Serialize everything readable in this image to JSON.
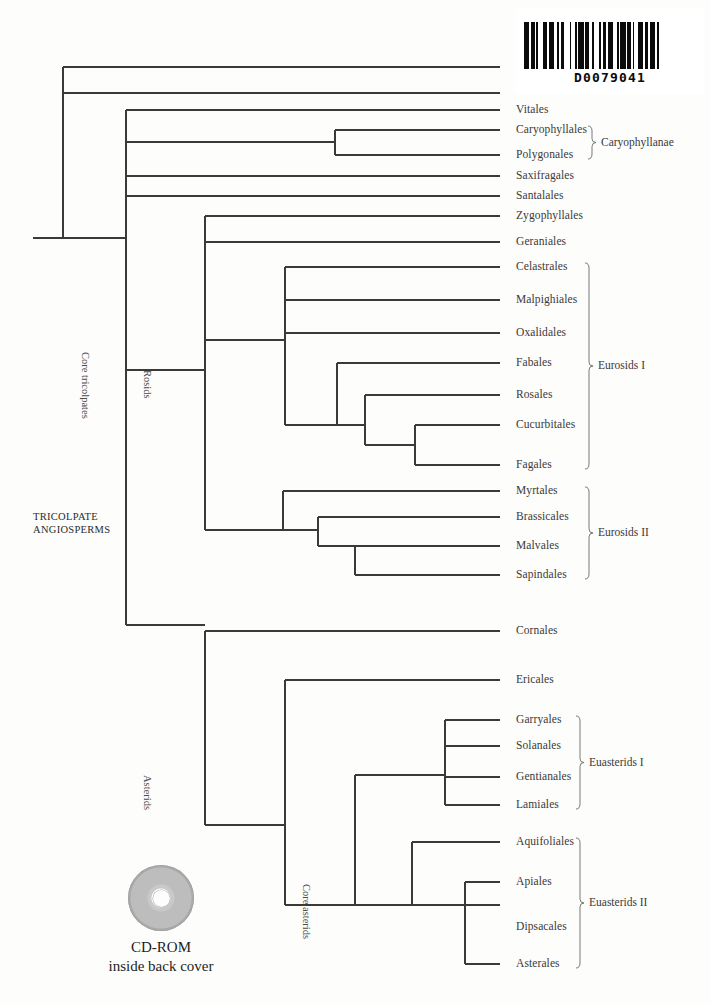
{
  "page": {
    "background_color": "#fdfdfc",
    "line_color": "#3a3a38"
  },
  "barcode": {
    "name": "barcode",
    "code_text": "D0079041",
    "bar_pattern": "3,1,2,1,1,3,2,1,3,2,1,1,2,3,1,2,1,1,3,1,2,2,1,3,1,1,2,1,3,2,1,1,3,1,2,1,1,2,3,1,2,1,3,1,1,2"
  },
  "root": {
    "label_line1": "TRICOLPATE",
    "label_line2": "ANGIOSPERMS"
  },
  "cdrom": {
    "line1": "CD-ROM",
    "line2": "inside back cover",
    "icon": "cd-disc-icon"
  },
  "chart_data": {
    "type": "tree",
    "orientation": "horizontal-rectangular",
    "tips": [
      {
        "name": "Vitales",
        "x": 500,
        "y": 110
      },
      {
        "name": "Caryophyllales",
        "x": 500,
        "y": 130
      },
      {
        "name": "Polygonales",
        "x": 500,
        "y": 155
      },
      {
        "name": "Saxifragales",
        "x": 500,
        "y": 176
      },
      {
        "name": "Santalales",
        "x": 500,
        "y": 196
      },
      {
        "name": "Zygophyllales",
        "x": 500,
        "y": 216
      },
      {
        "name": "Geraniales",
        "x": 500,
        "y": 242
      },
      {
        "name": "Celastrales",
        "x": 500,
        "y": 267
      },
      {
        "name": "Malpighiales",
        "x": 500,
        "y": 300
      },
      {
        "name": "Oxalidales",
        "x": 500,
        "y": 333
      },
      {
        "name": "Fabales",
        "x": 500,
        "y": 363
      },
      {
        "name": "Rosales",
        "x": 500,
        "y": 395
      },
      {
        "name": "Cucurbitales",
        "x": 500,
        "y": 425
      },
      {
        "name": "Fagales",
        "x": 500,
        "y": 465
      },
      {
        "name": "Myrtales",
        "x": 500,
        "y": 491
      },
      {
        "name": "Brassicales",
        "x": 500,
        "y": 517
      },
      {
        "name": "Malvales",
        "x": 500,
        "y": 546
      },
      {
        "name": "Sapindales",
        "x": 500,
        "y": 575
      },
      {
        "name": "Cornales",
        "x": 500,
        "y": 631
      },
      {
        "name": "Ericales",
        "x": 500,
        "y": 680
      },
      {
        "name": "Garryales",
        "x": 500,
        "y": 720
      },
      {
        "name": "Solanales",
        "x": 500,
        "y": 746
      },
      {
        "name": "Gentianales",
        "x": 500,
        "y": 777
      },
      {
        "name": "Lamiales",
        "x": 500,
        "y": 805
      },
      {
        "name": "Aquifoliales",
        "x": 500,
        "y": 842
      },
      {
        "name": "Apiales",
        "x": 500,
        "y": 882
      },
      {
        "name": "Dipsacales",
        "x": 500,
        "y": 927
      },
      {
        "name": "Asterales",
        "x": 500,
        "y": 964
      }
    ],
    "bracket_groups": [
      {
        "label": "Caryophyllanae",
        "from": "Caryophyllales",
        "to": "Polygonales"
      },
      {
        "label": "Eurosids I",
        "from": "Celastrales",
        "to": "Fagales"
      },
      {
        "label": "Eurosids II",
        "from": "Myrtales",
        "to": "Sapindales"
      },
      {
        "label": "Euasterids I",
        "from": "Garryales",
        "to": "Lamiales"
      },
      {
        "label": "Euasterids II",
        "from": "Aquifoliales",
        "to": "Asterales"
      }
    ],
    "internal_labels": [
      {
        "label": "Core tricolpates",
        "x": 90,
        "y": 352
      },
      {
        "label": "Rosids",
        "x": 152,
        "y": 370
      },
      {
        "label": "Asterids",
        "x": 152,
        "y": 775
      },
      {
        "label": "Core asterids",
        "x": 311,
        "y": 884
      }
    ]
  },
  "tip_labels": [
    "Vitales",
    "Caryophyllales",
    "Polygonales",
    "Saxifragales",
    "Santalales",
    "Zygophyllales",
    "Geraniales",
    "Celastrales",
    "Malpighiales",
    "Oxalidales",
    "Fabales",
    "Rosales",
    "Cucurbitales",
    "Fagales",
    "Myrtales",
    "Brassicales",
    "Malvales",
    "Sapindales",
    "Cornales",
    "Ericales",
    "Garryales",
    "Solanales",
    "Gentianales",
    "Lamiales",
    "Aquifoliales",
    "Apiales",
    "Dipsacales",
    "Asterales"
  ],
  "bracket_labels": [
    "Caryophyllanae",
    "Eurosids I",
    "Eurosids II",
    "Euasterids I",
    "Euasterids II"
  ],
  "rotated_labels": [
    "Core tricolpates",
    "Rosids",
    "Asterids",
    "Core asterids"
  ]
}
